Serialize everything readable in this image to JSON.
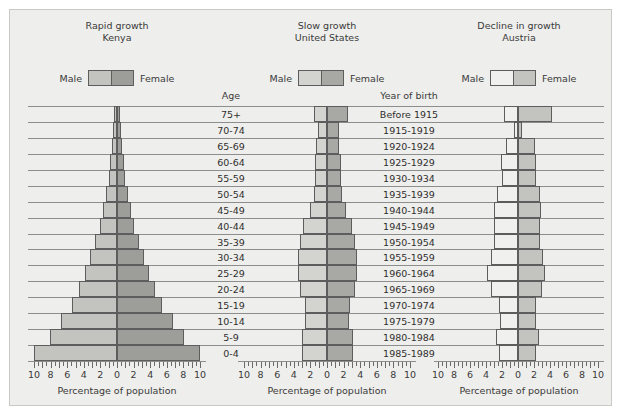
{
  "figure": {
    "background_color": "#eeeeec",
    "axis_title": "Percentage of population",
    "age_header": "Age",
    "year_header": "Year of birth"
  },
  "legend": {
    "male_label": "Male",
    "female_label": "Female"
  },
  "colors": {
    "male_kenya": "#c3c3c0",
    "female_kenya": "#9d9d9a",
    "male_us": "#d3d3d0",
    "female_us": "#a8a8a5",
    "male_austria": "#f0f0ee",
    "female_austria": "#c3c3c0",
    "outline": "#5d5d5d",
    "gridline": "#8d8d8d",
    "text": "#3a3a3a"
  },
  "age_groups": [
    "75+",
    "70-74",
    "65-69",
    "60-64",
    "55-59",
    "50-54",
    "45-49",
    "40-44",
    "35-39",
    "30-34",
    "25-29",
    "20-24",
    "15-19",
    "10-14",
    "5-9",
    "0-4"
  ],
  "years_of_birth": [
    "Before 1915",
    "1915-1919",
    "1920-1924",
    "1925-1929",
    "1930-1934",
    "1935-1939",
    "1940-1944",
    "1945-1949",
    "1950-1954",
    "1955-1959",
    "1960-1964",
    "1965-1969",
    "1970-1974",
    "1975-1979",
    "1980-1984",
    "1985-1989"
  ],
  "tick_values": [
    -10,
    -8,
    -6,
    -4,
    -2,
    0,
    2,
    4,
    6,
    8,
    10
  ],
  "tick_labels": [
    "10",
    "8",
    "6",
    "4",
    "2",
    "0",
    "2",
    "4",
    "6",
    "8",
    "10"
  ],
  "chart_data": [
    {
      "type": "bar",
      "subtype": "population-pyramid",
      "title": "Rapid growth\nKenya",
      "growth_label": "Rapid growth",
      "country": "Kenya",
      "xlabel": "Percentage of population",
      "ylabel": "Age",
      "xlim": [
        -10,
        10
      ],
      "grid": true,
      "legend_position": "top",
      "categories": [
        "75+",
        "70-74",
        "65-69",
        "60-64",
        "55-59",
        "50-54",
        "45-49",
        "40-44",
        "35-39",
        "30-34",
        "25-29",
        "20-24",
        "15-19",
        "10-14",
        "5-9",
        "0-4"
      ],
      "series": [
        {
          "name": "Male",
          "values": [
            0.4,
            0.5,
            0.6,
            0.8,
            1.0,
            1.3,
            1.7,
            2.1,
            2.6,
            3.2,
            3.9,
            4.6,
            5.4,
            6.8,
            8.1,
            10.0
          ]
        },
        {
          "name": "Female",
          "values": [
            0.4,
            0.5,
            0.6,
            0.8,
            1.0,
            1.3,
            1.7,
            2.1,
            2.6,
            3.2,
            3.9,
            4.6,
            5.4,
            6.8,
            8.1,
            10.0
          ]
        }
      ]
    },
    {
      "type": "bar",
      "subtype": "population-pyramid",
      "title": "Slow growth\nUnited States",
      "growth_label": "Slow growth",
      "country": "United States",
      "xlabel": "Percentage of population",
      "ylabel": "Year of birth",
      "xlim": [
        -10,
        10
      ],
      "grid": true,
      "legend_position": "top",
      "categories": [
        "Before 1915",
        "1915-1919",
        "1920-1924",
        "1925-1929",
        "1930-1934",
        "1935-1939",
        "1940-1944",
        "1945-1949",
        "1950-1954",
        "1955-1959",
        "1960-1964",
        "1965-1969",
        "1970-1974",
        "1975-1979",
        "1980-1984",
        "1985-1989"
      ],
      "series": [
        {
          "name": "Male",
          "values": [
            1.6,
            1.1,
            1.3,
            1.5,
            1.5,
            1.6,
            2.1,
            2.9,
            3.3,
            3.5,
            3.5,
            3.3,
            2.7,
            2.6,
            3.0,
            3.0
          ]
        },
        {
          "name": "Female",
          "values": [
            2.5,
            1.4,
            1.5,
            1.7,
            1.7,
            1.8,
            2.3,
            3.0,
            3.4,
            3.6,
            3.6,
            3.4,
            2.8,
            2.7,
            3.1,
            3.1
          ]
        }
      ]
    },
    {
      "type": "bar",
      "subtype": "population-pyramid",
      "title": "Decline in growth\nAustria",
      "growth_label": "Decline in growth",
      "country": "Austria",
      "xlabel": "Percentage of population",
      "ylabel": "Year of birth",
      "xlim": [
        -10,
        10
      ],
      "grid": true,
      "legend_position": "top",
      "categories": [
        "Before 1915",
        "1915-1919",
        "1920-1924",
        "1925-1929",
        "1930-1934",
        "1935-1939",
        "1940-1944",
        "1945-1949",
        "1950-1954",
        "1955-1959",
        "1960-1964",
        "1965-1969",
        "1970-1974",
        "1975-1979",
        "1980-1984",
        "1985-1989"
      ],
      "series": [
        {
          "name": "Male",
          "values": [
            1.8,
            0.5,
            1.5,
            2.1,
            2.0,
            2.6,
            3.0,
            3.0,
            3.0,
            3.4,
            3.9,
            3.4,
            2.4,
            2.3,
            2.8,
            2.4
          ]
        },
        {
          "name": "Female",
          "values": [
            4.3,
            0.5,
            2.1,
            2.3,
            2.2,
            2.7,
            2.9,
            2.8,
            2.7,
            3.1,
            3.4,
            3.0,
            2.3,
            2.2,
            2.6,
            2.3
          ]
        }
      ]
    }
  ],
  "panels": [
    {
      "key": "kenya",
      "left": 18,
      "width": 178,
      "axis_left": 24,
      "axis_width": 166,
      "male_color": "#c3c3c0",
      "female_color": "#9d9d9a"
    },
    {
      "key": "us",
      "left": 228,
      "width": 178,
      "axis_left": 234,
      "axis_width": 166,
      "male_color": "#d3d3d0",
      "female_color": "#a8a8a5"
    },
    {
      "key": "austria",
      "left": 424,
      "width": 170,
      "axis_left": 428,
      "axis_width": 160,
      "male_color": "#f0f0ee",
      "female_color": "#c3c3c0"
    }
  ],
  "label_columns": [
    {
      "key": "age",
      "left": 190,
      "width": 62,
      "header": "Age"
    },
    {
      "key": "year",
      "left": 362,
      "width": 74,
      "header": "Year of birth"
    }
  ]
}
